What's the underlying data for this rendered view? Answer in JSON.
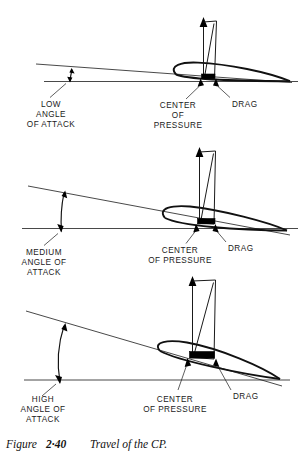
{
  "figure": {
    "caption_prefix": "Figure",
    "caption_number": "2·40",
    "caption_text": "Travel of the CP.",
    "title": "Travel of the CP."
  },
  "panels": [
    {
      "id": "low",
      "angle_label_lines": [
        "LOW",
        "ANGLE",
        "OF  ATTACK"
      ],
      "cp_label_lines": [
        "CENTER",
        "OF",
        "PRESSURE"
      ],
      "drag_label": "DRAG",
      "angle_of_attack": "low",
      "cp_position_fraction": 0.42
    },
    {
      "id": "medium",
      "angle_label_lines": [
        "MEDIUM",
        "ANGLE OF",
        "ATTACK"
      ],
      "cp_label_lines": [
        "CENTER",
        "OF PRESSURE"
      ],
      "drag_label": "DRAG",
      "angle_of_attack": "medium",
      "cp_position_fraction": 0.36
    },
    {
      "id": "high",
      "angle_label_lines": [
        "HIGH",
        "ANGLE OF",
        "ATTACK"
      ],
      "cp_label_lines": [
        "CENTER",
        "OF PRESSURE"
      ],
      "drag_label": "DRAG",
      "angle_of_attack": "high",
      "cp_position_fraction": 0.3
    }
  ],
  "colors": {
    "ink": "#111111",
    "line": "#1a1a1a",
    "paper": "#ffffff"
  }
}
